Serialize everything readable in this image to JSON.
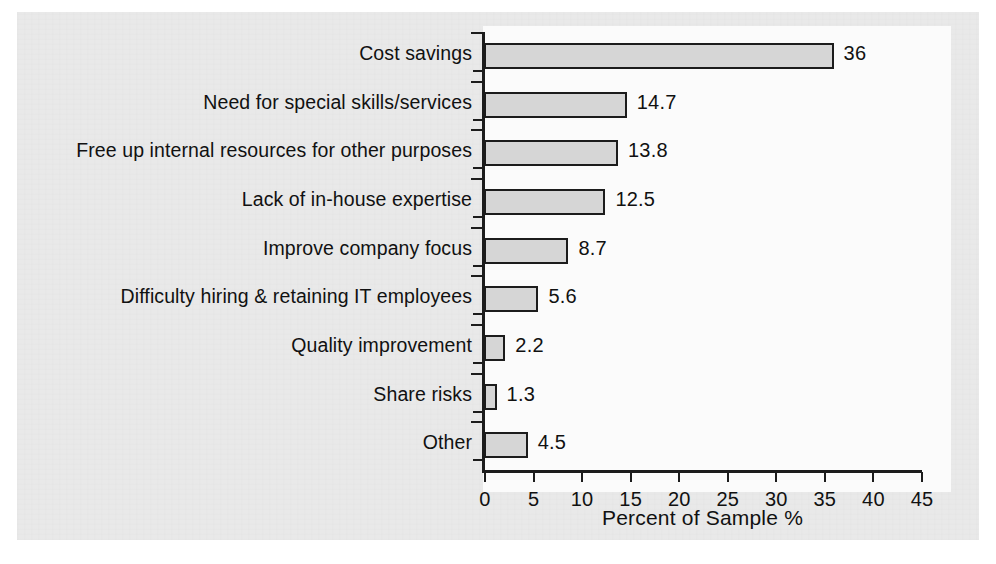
{
  "chart_data": {
    "type": "bar",
    "orientation": "horizontal",
    "title": "",
    "xlabel": "Percent of Sample %",
    "ylabel": "",
    "xlim": [
      0,
      45
    ],
    "xticks": [
      0,
      5,
      10,
      15,
      20,
      25,
      30,
      35,
      40,
      45
    ],
    "xtick_labels": [
      "0",
      "5",
      "10",
      "15",
      "20",
      "25",
      "30",
      "35",
      "40",
      "45"
    ],
    "grid": false,
    "legend": false,
    "categories": [
      "Cost savings",
      "Need for special skills/services",
      "Free up internal resources for other purposes",
      "Lack of in-house expertise",
      "Improve company focus",
      "Difficulty hiring & retaining IT employees",
      "Quality improvement",
      "Share risks",
      "Other"
    ],
    "values": [
      36,
      14.7,
      13.8,
      12.5,
      8.7,
      5.6,
      2.2,
      1.3,
      4.5
    ],
    "value_labels": [
      "36",
      "14.7",
      "13.8",
      "12.5",
      "8.7",
      "5.6",
      "2.2",
      "1.3",
      "4.5"
    ],
    "bar_fill_color": "#d6d6d6",
    "bar_edge_color": "#1c1c1c",
    "axis_color": "#1c1c1c",
    "plot_background": "#fbfbfb",
    "page_background": "#e9e9e9"
  }
}
